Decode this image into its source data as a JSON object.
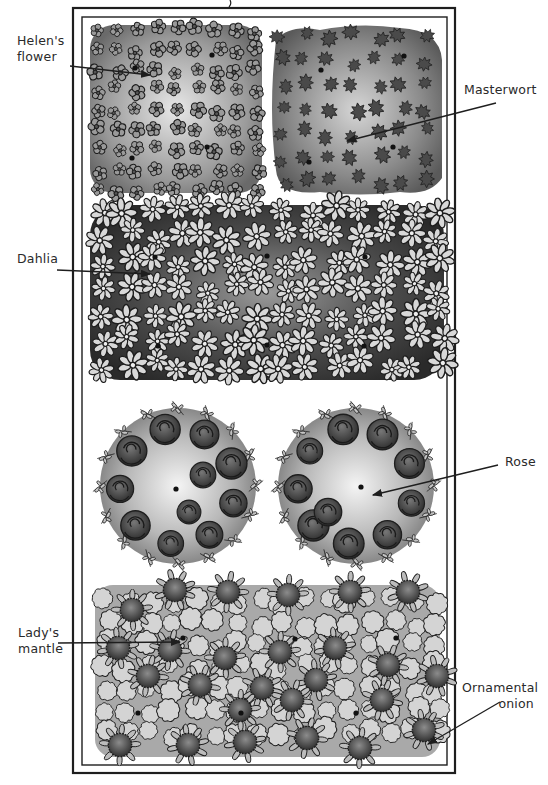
{
  "diagram": {
    "type": "garden-bed-planting-plan",
    "frame": {
      "outer": [
        73,
        8,
        455,
        773
      ],
      "inner": [
        82,
        17,
        447,
        765
      ]
    },
    "colors": {
      "ink": "#1e1e1e",
      "paper": "#ffffff",
      "shade_dark": "#3a3a3a",
      "shade_mid": "#7a7a7a",
      "shade_light": "#c8c8c8"
    },
    "labels": [
      {
        "id": "helens-flower",
        "text": "Helen's\nflower",
        "x": 17,
        "y": 35,
        "side": "left",
        "arrow": {
          "from": [
            70,
            66
          ],
          "to": [
            150,
            75
          ]
        }
      },
      {
        "id": "masterwort",
        "text": "Masterwort",
        "x": 465,
        "y": 83,
        "side": "right",
        "arrow": {
          "from": [
            496,
            103
          ],
          "to": [
            347,
            141
          ]
        }
      },
      {
        "id": "dahlia",
        "text": "Dahlia",
        "x": 17,
        "y": 252,
        "side": "left",
        "arrow": {
          "from": [
            57,
            270
          ],
          "to": [
            150,
            274
          ]
        }
      },
      {
        "id": "rose",
        "text": "Rose",
        "x": 506,
        "y": 455,
        "side": "right",
        "arrow": {
          "from": [
            498,
            465
          ],
          "to": [
            373,
            495
          ]
        }
      },
      {
        "id": "ladys-mantle",
        "text": "Lady's\nmantle",
        "x": 18,
        "y": 626,
        "side": "left",
        "arrow": {
          "from": [
            58,
            643
          ],
          "to": [
            180,
            642
          ]
        }
      },
      {
        "id": "ornamental-onion",
        "text": "Ornamental\nonion",
        "x": 465,
        "y": 681,
        "side": "right",
        "arrow": {
          "from": [
            500,
            702
          ],
          "to": [
            428,
            744
          ]
        }
      }
    ],
    "beds": [
      {
        "id": "helens-flower-bed",
        "plant": "Helen's flower",
        "bbox": [
          87,
          20,
          262,
          195
        ],
        "tone": "light",
        "planting_dots": [
          [
            135,
            68
          ],
          [
            212,
            55
          ],
          [
            132,
            158
          ],
          [
            207,
            147
          ]
        ]
      },
      {
        "id": "masterwort-bed",
        "plant": "Masterwort",
        "bbox": [
          270,
          25,
          443,
          195
        ],
        "tone": "mid",
        "planting_dots": [
          [
            321,
            70
          ],
          [
            404,
            56
          ],
          [
            309,
            162
          ],
          [
            393,
            147
          ]
        ]
      },
      {
        "id": "dahlia-bed",
        "plant": "Dahlia",
        "bbox": [
          88,
          197,
          445,
          385
        ],
        "tone": "dark",
        "planting_dots": [
          [
            155,
            257
          ],
          [
            267,
            256
          ],
          [
            365,
            257
          ],
          [
            158,
            346
          ],
          [
            267,
            345
          ],
          [
            364,
            346
          ]
        ]
      },
      {
        "id": "rose-bed-left",
        "plant": "Rose",
        "bbox": [
          100,
          400,
          266,
          565
        ],
        "tone": "mid",
        "planting_dots": [
          [
            176,
            489
          ]
        ]
      },
      {
        "id": "rose-bed-right",
        "plant": "Rose",
        "bbox": [
          272,
          400,
          440,
          565
        ],
        "tone": "mid",
        "planting_dots": [
          [
            361,
            487
          ]
        ]
      },
      {
        "id": "lady-mantle-onion-bed",
        "plant": "Lady's mantle / Ornamental onion",
        "bbox": [
          88,
          570,
          446,
          762
        ],
        "tone": "mixed",
        "planting_dots": [
          [
            183,
            638
          ],
          [
            295,
            639
          ],
          [
            396,
            638
          ],
          [
            138,
            713
          ],
          [
            241,
            713
          ],
          [
            356,
            713
          ]
        ]
      }
    ]
  }
}
